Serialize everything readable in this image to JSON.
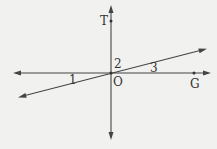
{
  "diagram": {
    "type": "geometry-lines",
    "points": {
      "T": {
        "label": "T",
        "x": 111,
        "y": 21
      },
      "O": {
        "label": "O",
        "x": 111,
        "y": 73
      },
      "G": {
        "label": "G",
        "x": 194,
        "y": 73
      }
    },
    "angles": [
      {
        "label": "1",
        "x": 70,
        "y": 83
      },
      {
        "label": "2",
        "x": 114,
        "y": 66
      },
      {
        "label": "3",
        "x": 150,
        "y": 73
      }
    ],
    "lines": [
      {
        "name": "horizontal",
        "x1": 15,
        "y1": 73,
        "x2": 210,
        "y2": 73
      },
      {
        "name": "vertical",
        "x1": 111,
        "y1": 5,
        "x2": 111,
        "y2": 139
      },
      {
        "name": "oblique",
        "x1": 19,
        "y1": 97,
        "x2": 206,
        "y2": 49
      }
    ],
    "colors": {
      "line": "#444444",
      "background": "#f1f1ef"
    }
  }
}
